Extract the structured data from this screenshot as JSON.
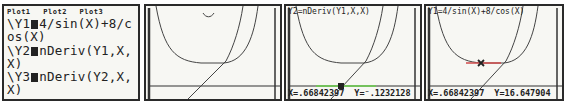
{
  "screen1": {
    "plots": [
      "Plot1",
      "Plot2",
      "Plot3"
    ],
    "lines": [
      {
        "prefix": "\\Y1",
        "expr": "4/sin(X)+8/c"
      },
      {
        "prefix": "",
        "expr": "os(X)"
      },
      {
        "prefix": "\\Y2",
        "expr": "nDeriv(Y1,X,"
      },
      {
        "prefix": "",
        "expr": "X)"
      },
      {
        "prefix": "\\Y3",
        "expr": "nDeriv(Y2,X,"
      },
      {
        "prefix": "",
        "expr": "X)"
      },
      {
        "prefix": "\\Y4",
        "expr": "="
      }
    ]
  },
  "screen2": {
    "description": "graph of Y1 (U-shaped curve) and Y2 (increasing curve) with x-axis"
  },
  "screen3": {
    "header": "Y2=nDeriv(Y1,X,X)",
    "x_readout": "X=.66842397",
    "y_readout": "Y=⁻.1232128",
    "trace_color": "#6ad04a"
  },
  "screen4": {
    "header": "Y1=4/sin(X)+8/cos(X)",
    "x_readout": "X=.66842397",
    "y_readout": "Y=16.647904",
    "trace_color": "#d04a4a"
  }
}
